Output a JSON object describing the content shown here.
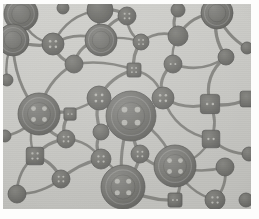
{
  "figure": {
    "rendering": "grayscale-halftone-photograph"
  },
  "plate": {
    "x": 3,
    "y": 4,
    "width": 248,
    "height": 205,
    "background_color": "#c9c9c5",
    "paper_color": "#fdfdfc",
    "node_fill_color": "#767672",
    "node_fill_dark": "#636360",
    "node_rim_color": "#5c5c59",
    "node_highlight_color": "#8e8e8a",
    "link_color": "#7e7e7a",
    "hole_color": "#b9b9b4"
  },
  "legend": {
    "node_shapes": [
      "circle",
      "square"
    ],
    "hole_counts": [
      2,
      4
    ],
    "size_classes": [
      "large",
      "medium",
      "small"
    ]
  },
  "chart_data": {
    "type": "scatter",
    "xlabel": "",
    "ylabel": "",
    "xlim": [
      0,
      248
    ],
    "ylim": [
      0,
      205
    ],
    "grid": false,
    "legend_position": "none",
    "counts": {
      "nodes": 40,
      "links": 62,
      "circle_nodes": 33,
      "square_nodes": 7,
      "large_nodes": 8,
      "medium_nodes": 10,
      "small_nodes": 22
    },
    "nodes": [
      {
        "id": "n01",
        "x": 18,
        "y": 10,
        "r": 17,
        "shape": "circle",
        "holes": 0,
        "size": "large",
        "clipped": "top-left"
      },
      {
        "id": "n02",
        "x": 97,
        "y": 6,
        "r": 13,
        "shape": "circle",
        "holes": 0,
        "size": "medium",
        "clipped": "top"
      },
      {
        "id": "n03",
        "x": 124,
        "y": 12,
        "r": 9,
        "shape": "circle",
        "holes": 4,
        "size": "small",
        "clipped": "none"
      },
      {
        "id": "n04",
        "x": 175,
        "y": 6,
        "r": 7,
        "shape": "circle",
        "holes": 0,
        "size": "small",
        "clipped": "top"
      },
      {
        "id": "n05",
        "x": 214,
        "y": 9,
        "r": 16,
        "shape": "circle",
        "holes": 0,
        "size": "large",
        "clipped": "top"
      },
      {
        "id": "n06",
        "x": 10,
        "y": 36,
        "r": 16,
        "shape": "circle",
        "holes": 0,
        "size": "large",
        "clipped": "left"
      },
      {
        "id": "n07",
        "x": 50,
        "y": 40,
        "r": 11,
        "shape": "circle",
        "holes": 4,
        "size": "medium",
        "clipped": "none"
      },
      {
        "id": "n08",
        "x": 98,
        "y": 36,
        "r": 16,
        "shape": "circle",
        "holes": 0,
        "size": "large",
        "clipped": "none"
      },
      {
        "id": "n09",
        "x": 138,
        "y": 38,
        "r": 8,
        "shape": "circle",
        "holes": 4,
        "size": "small",
        "clipped": "none"
      },
      {
        "id": "n10",
        "x": 175,
        "y": 32,
        "r": 10,
        "shape": "circle",
        "holes": 0,
        "size": "medium",
        "clipped": "none"
      },
      {
        "id": "n11",
        "x": 223,
        "y": 53,
        "r": 8,
        "shape": "circle",
        "holes": 0,
        "size": "small",
        "clipped": "none"
      },
      {
        "id": "n12",
        "x": 71,
        "y": 60,
        "r": 9,
        "shape": "circle",
        "holes": 0,
        "size": "small",
        "clipped": "none"
      },
      {
        "id": "n13",
        "x": 131,
        "y": 66,
        "r": 8,
        "shape": "square",
        "holes": 4,
        "size": "small",
        "clipped": "none"
      },
      {
        "id": "n14",
        "x": 170,
        "y": 60,
        "r": 9,
        "shape": "circle",
        "holes": 2,
        "size": "small",
        "clipped": "none"
      },
      {
        "id": "n15",
        "x": 96,
        "y": 94,
        "r": 12,
        "shape": "circle",
        "holes": 4,
        "size": "medium",
        "clipped": "none"
      },
      {
        "id": "n16",
        "x": 160,
        "y": 94,
        "r": 11,
        "shape": "circle",
        "holes": 4,
        "size": "medium",
        "clipped": "none"
      },
      {
        "id": "n17",
        "x": 207,
        "y": 100,
        "r": 11,
        "shape": "square",
        "holes": 2,
        "size": "medium",
        "clipped": "none"
      },
      {
        "id": "n18",
        "x": 245,
        "y": 95,
        "r": 9,
        "shape": "square",
        "holes": 0,
        "size": "small",
        "clipped": "right"
      },
      {
        "id": "n19",
        "x": 36,
        "y": 110,
        "r": 21,
        "shape": "circle",
        "holes": 4,
        "size": "large",
        "clipped": "none"
      },
      {
        "id": "n20",
        "x": 128,
        "y": 112,
        "r": 25,
        "shape": "circle",
        "holes": 4,
        "size": "large",
        "clipped": "none"
      },
      {
        "id": "n21",
        "x": 67,
        "y": 110,
        "r": 7,
        "shape": "square",
        "holes": 2,
        "size": "small",
        "clipped": "none"
      },
      {
        "id": "n22",
        "x": 98,
        "y": 128,
        "r": 8,
        "shape": "circle",
        "holes": 0,
        "size": "small",
        "clipped": "none"
      },
      {
        "id": "n23",
        "x": 63,
        "y": 135,
        "r": 9,
        "shape": "circle",
        "holes": 4,
        "size": "small",
        "clipped": "none"
      },
      {
        "id": "n24",
        "x": 208,
        "y": 135,
        "r": 10,
        "shape": "square",
        "holes": 2,
        "size": "medium",
        "clipped": "none"
      },
      {
        "id": "n25",
        "x": 32,
        "y": 152,
        "r": 10,
        "shape": "square",
        "holes": 4,
        "size": "medium",
        "clipped": "none"
      },
      {
        "id": "n26",
        "x": 98,
        "y": 155,
        "r": 10,
        "shape": "circle",
        "holes": 4,
        "size": "medium",
        "clipped": "none"
      },
      {
        "id": "n27",
        "x": 137,
        "y": 150,
        "r": 9,
        "shape": "circle",
        "holes": 4,
        "size": "small",
        "clipped": "none"
      },
      {
        "id": "n28",
        "x": 172,
        "y": 162,
        "r": 21,
        "shape": "circle",
        "holes": 4,
        "size": "large",
        "clipped": "none"
      },
      {
        "id": "n29",
        "x": 222,
        "y": 163,
        "r": 9,
        "shape": "circle",
        "holes": 0,
        "size": "small",
        "clipped": "none"
      },
      {
        "id": "n30",
        "x": 58,
        "y": 175,
        "r": 9,
        "shape": "circle",
        "holes": 4,
        "size": "small",
        "clipped": "none"
      },
      {
        "id": "n31",
        "x": 120,
        "y": 183,
        "r": 22,
        "shape": "circle",
        "holes": 4,
        "size": "large",
        "clipped": "bottom"
      },
      {
        "id": "n32",
        "x": 14,
        "y": 190,
        "r": 9,
        "shape": "circle",
        "holes": 0,
        "size": "small",
        "clipped": "bottom-left"
      },
      {
        "id": "n33",
        "x": 172,
        "y": 196,
        "r": 8,
        "shape": "square",
        "holes": 2,
        "size": "small",
        "clipped": "bottom"
      },
      {
        "id": "n34",
        "x": 212,
        "y": 196,
        "r": 10,
        "shape": "circle",
        "holes": 4,
        "size": "small",
        "clipped": "bottom"
      },
      {
        "id": "n35",
        "x": 244,
        "y": 44,
        "r": 6,
        "shape": "circle",
        "holes": 0,
        "size": "small",
        "clipped": "right"
      },
      {
        "id": "n36",
        "x": 246,
        "y": 150,
        "r": 7,
        "shape": "circle",
        "holes": 0,
        "size": "small",
        "clipped": "right"
      },
      {
        "id": "n37",
        "x": 4,
        "y": 76,
        "r": 6,
        "shape": "circle",
        "holes": 0,
        "size": "small",
        "clipped": "left"
      },
      {
        "id": "n38",
        "x": 60,
        "y": 4,
        "r": 6,
        "shape": "circle",
        "holes": 0,
        "size": "small",
        "clipped": "top"
      },
      {
        "id": "n39",
        "x": 2,
        "y": 132,
        "r": 6,
        "shape": "circle",
        "holes": 0,
        "size": "small",
        "clipped": "left"
      },
      {
        "id": "n40",
        "x": 243,
        "y": 196,
        "r": 7,
        "shape": "circle",
        "holes": 0,
        "size": "small",
        "clipped": "bottom-right"
      }
    ],
    "links": [
      {
        "from": "n01",
        "to": "n07",
        "curve": 14
      },
      {
        "from": "n01",
        "to": "n06",
        "curve": -8
      },
      {
        "from": "n06",
        "to": "n07",
        "curve": 6
      },
      {
        "from": "n07",
        "to": "n08",
        "curve": -12
      },
      {
        "from": "n07",
        "to": "n12",
        "curve": 8
      },
      {
        "from": "n07",
        "to": "n02",
        "curve": -16
      },
      {
        "from": "n02",
        "to": "n08",
        "curve": 4
      },
      {
        "from": "n02",
        "to": "n03",
        "curve": -6
      },
      {
        "from": "n03",
        "to": "n09",
        "curve": 8
      },
      {
        "from": "n03",
        "to": "n08",
        "curve": 10
      },
      {
        "from": "n08",
        "to": "n09",
        "curve": -6
      },
      {
        "from": "n08",
        "to": "n12",
        "curve": 12
      },
      {
        "from": "n09",
        "to": "n13",
        "curve": 6
      },
      {
        "from": "n09",
        "to": "n10",
        "curve": -10
      },
      {
        "from": "n04",
        "to": "n10",
        "curve": 8
      },
      {
        "from": "n10",
        "to": "n14",
        "curve": 5
      },
      {
        "from": "n10",
        "to": "n05",
        "curve": -12
      },
      {
        "from": "n05",
        "to": "n11",
        "curve": 10
      },
      {
        "from": "n11",
        "to": "n14",
        "curve": -14
      },
      {
        "from": "n11",
        "to": "n17",
        "curve": 16
      },
      {
        "from": "n12",
        "to": "n13",
        "curve": -8
      },
      {
        "from": "n12",
        "to": "n19",
        "curve": 14
      },
      {
        "from": "n13",
        "to": "n15",
        "curve": 10
      },
      {
        "from": "n13",
        "to": "n16",
        "curve": -12
      },
      {
        "from": "n14",
        "to": "n16",
        "curve": 12
      },
      {
        "from": "n15",
        "to": "n19",
        "curve": -10
      },
      {
        "from": "n15",
        "to": "n20",
        "curve": 8
      },
      {
        "from": "n15",
        "to": "n22",
        "curve": 6
      },
      {
        "from": "n16",
        "to": "n20",
        "curve": -8
      },
      {
        "from": "n16",
        "to": "n17",
        "curve": 10
      },
      {
        "from": "n16",
        "to": "n24",
        "curve": 18
      },
      {
        "from": "n17",
        "to": "n24",
        "curve": -8
      },
      {
        "from": "n17",
        "to": "n18",
        "curve": 6
      },
      {
        "from": "n19",
        "to": "n21",
        "curve": -6
      },
      {
        "from": "n19",
        "to": "n23",
        "curve": 10
      },
      {
        "from": "n19",
        "to": "n25",
        "curve": 12
      },
      {
        "from": "n19",
        "to": "n06",
        "curve": -14
      },
      {
        "from": "n21",
        "to": "n23",
        "curve": 8
      },
      {
        "from": "n22",
        "to": "n20",
        "curve": -6
      },
      {
        "from": "n22",
        "to": "n26",
        "curve": 8
      },
      {
        "from": "n23",
        "to": "n26",
        "curve": -10
      },
      {
        "from": "n23",
        "to": "n25",
        "curve": 7
      },
      {
        "from": "n20",
        "to": "n27",
        "curve": 6
      },
      {
        "from": "n20",
        "to": "n28",
        "curve": -14
      },
      {
        "from": "n20",
        "to": "n31",
        "curve": 10
      },
      {
        "from": "n24",
        "to": "n28",
        "curve": -10
      },
      {
        "from": "n24",
        "to": "n36",
        "curve": 8
      },
      {
        "from": "n25",
        "to": "n30",
        "curve": -8
      },
      {
        "from": "n25",
        "to": "n32",
        "curve": 10
      },
      {
        "from": "n26",
        "to": "n30",
        "curve": 6
      },
      {
        "from": "n26",
        "to": "n31",
        "curve": -8
      },
      {
        "from": "n27",
        "to": "n28",
        "curve": 10
      },
      {
        "from": "n27",
        "to": "n31",
        "curve": -6
      },
      {
        "from": "n28",
        "to": "n29",
        "curve": 8
      },
      {
        "from": "n28",
        "to": "n33",
        "curve": -10
      },
      {
        "from": "n28",
        "to": "n34",
        "curve": 12
      },
      {
        "from": "n29",
        "to": "n34",
        "curve": -8
      },
      {
        "from": "n31",
        "to": "n33",
        "curve": 8
      },
      {
        "from": "n30",
        "to": "n32",
        "curve": -8
      },
      {
        "from": "n05",
        "to": "n35",
        "curve": 8
      },
      {
        "from": "n06",
        "to": "n37",
        "curve": 6
      },
      {
        "from": "n19",
        "to": "n39",
        "curve": -8
      }
    ]
  }
}
